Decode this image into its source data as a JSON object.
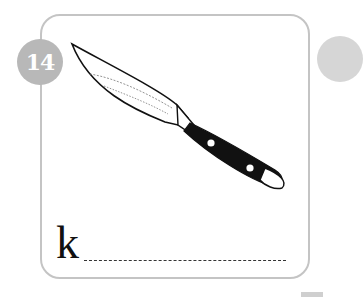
{
  "card": {
    "number": "14",
    "starting_letter": "k",
    "illustration": "knife",
    "answer_line": "dashed writing line"
  },
  "colors": {
    "badge": "#b8b8b8",
    "border": "#c4c4c4",
    "handle": "#111111"
  }
}
